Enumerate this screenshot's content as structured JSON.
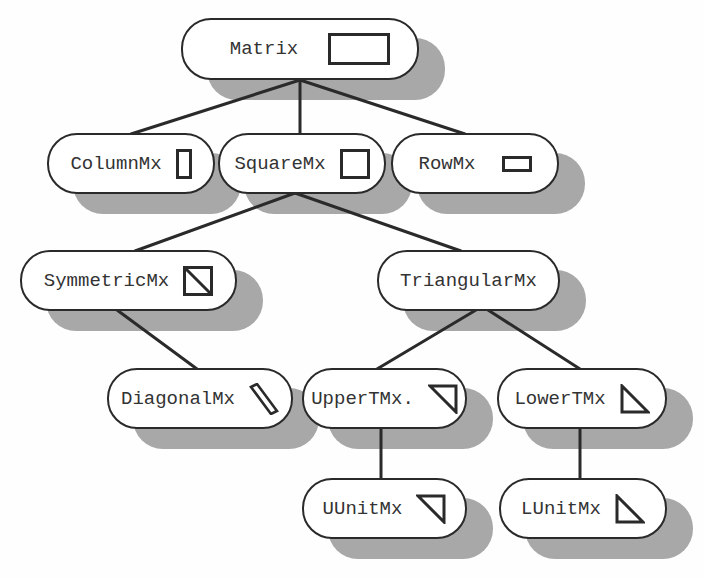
{
  "diagram": {
    "colors": {
      "background": "#fefefe",
      "node_fill": "#ffffff",
      "node_stroke": "#2a2a2a",
      "shadow": "#a8a8a8",
      "text": "#333333"
    },
    "nodes": [
      {
        "id": "matrix",
        "label": "Matrix",
        "icon": "rectangle-icon",
        "x": 181,
        "y": 18,
        "w": 238,
        "h": 62
      },
      {
        "id": "columnmx",
        "label": "ColumnMx",
        "icon": "tall-rectangle-icon",
        "x": 47,
        "y": 133,
        "w": 168,
        "h": 61
      },
      {
        "id": "squaremx",
        "label": "SquareMx",
        "icon": "square-icon",
        "x": 218,
        "y": 133,
        "w": 168,
        "h": 61
      },
      {
        "id": "rowmx",
        "label": "RowMx",
        "icon": "wide-rectangle-icon",
        "x": 391,
        "y": 133,
        "w": 168,
        "h": 61
      },
      {
        "id": "symmetricmx",
        "label": "SymmetricMx",
        "icon": "square-diagonal-icon",
        "x": 20,
        "y": 250,
        "w": 217,
        "h": 61
      },
      {
        "id": "triangularmx",
        "label": "TriangularMx",
        "icon": "",
        "x": 377,
        "y": 250,
        "w": 183,
        "h": 61
      },
      {
        "id": "diagonalmx",
        "label": "DiagonalMx",
        "icon": "diagonal-bar-icon",
        "x": 107,
        "y": 368,
        "w": 186,
        "h": 61
      },
      {
        "id": "uppertmx",
        "label": "UpperTMx.",
        "icon": "upper-triangle-icon",
        "x": 302,
        "y": 368,
        "w": 165,
        "h": 61
      },
      {
        "id": "lowertmx",
        "label": "LowerTMx",
        "icon": "lower-triangle-icon",
        "x": 497,
        "y": 368,
        "w": 170,
        "h": 61
      },
      {
        "id": "uunitmx",
        "label": "UUnitMx",
        "icon": "upper-triangle-icon",
        "x": 302,
        "y": 478,
        "w": 165,
        "h": 61
      },
      {
        "id": "lunitmx",
        "label": "LUnitMx",
        "icon": "lower-triangle-icon",
        "x": 499,
        "y": 478,
        "w": 168,
        "h": 61
      }
    ],
    "edges": [
      {
        "from": "matrix",
        "to": "columnmx",
        "x1": 300,
        "y1": 80,
        "x2": 131,
        "y2": 134
      },
      {
        "from": "matrix",
        "to": "squaremx",
        "x1": 300,
        "y1": 80,
        "x2": 300,
        "y2": 134
      },
      {
        "from": "matrix",
        "to": "rowmx",
        "x1": 300,
        "y1": 80,
        "x2": 465,
        "y2": 134
      },
      {
        "from": "squaremx",
        "to": "symmetricmx",
        "x1": 295,
        "y1": 193,
        "x2": 135,
        "y2": 251
      },
      {
        "from": "squaremx",
        "to": "triangularmx",
        "x1": 295,
        "y1": 193,
        "x2": 461,
        "y2": 251
      },
      {
        "from": "symmetricmx",
        "to": "diagonalmx",
        "x1": 117,
        "y1": 310,
        "x2": 197,
        "y2": 369
      },
      {
        "from": "triangularmx",
        "to": "uppertmx",
        "x1": 476,
        "y1": 310,
        "x2": 377,
        "y2": 369
      },
      {
        "from": "triangularmx",
        "to": "lowertmx",
        "x1": 488,
        "y1": 310,
        "x2": 580,
        "y2": 369
      },
      {
        "from": "uppertmx",
        "to": "uunitmx",
        "x1": 381,
        "y1": 428,
        "x2": 381,
        "y2": 479
      },
      {
        "from": "lowertmx",
        "to": "lunitmx",
        "x1": 580,
        "y1": 428,
        "x2": 580,
        "y2": 479
      }
    ]
  }
}
